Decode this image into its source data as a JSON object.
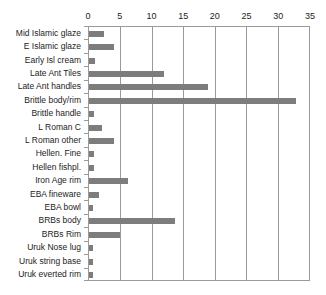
{
  "chart_data": {
    "type": "bar",
    "orientation": "horizontal",
    "title": "",
    "xlabel": "",
    "ylabel": "",
    "xlim": [
      0,
      35
    ],
    "xticks": [
      0,
      5,
      10,
      15,
      20,
      25,
      30,
      35
    ],
    "grid": true,
    "legend": false,
    "bar_color": "#7d7d7d",
    "axis_color": "#9a9a9a",
    "categories": [
      "Mid Islamic  glaze",
      "E Islamic  glaze",
      "Early Isl cream",
      "Late Ant Tiles",
      "Late Ant handles",
      "Brittle body/rim",
      "Brittle handle",
      "L Roman C",
      "L Roman other",
      "Hellen. Fine",
      "Hellen fishpl.",
      "Iron Age rim",
      "EBA fineware",
      "EBA bowl",
      "BRBs body",
      "BRBs Rim",
      "Uruk Nose  lug",
      "Uruk string base",
      "Uruk everted rim"
    ],
    "values": [
      2.4,
      4.0,
      1.0,
      12.0,
      19.0,
      33.0,
      0.8,
      2.0,
      4.0,
      0.8,
      0.8,
      6.2,
      1.6,
      0.7,
      13.7,
      5.0,
      0.7,
      0.7,
      0.7
    ]
  },
  "caption": {
    "text": ""
  }
}
